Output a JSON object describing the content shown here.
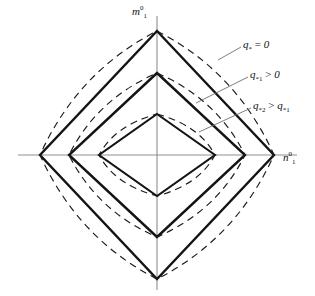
{
  "figure": {
    "kind": "yield-locus-diagram",
    "background": "#ffffff",
    "ink": "#111111",
    "axis_color": "#8a8a8a",
    "solid_color": "#141414",
    "dashed_color": "#1a1a1a"
  },
  "axes": {
    "y_label_base": "m",
    "y_label_sup": "0",
    "y_label_sub": "1",
    "x_label_base": "n",
    "x_label_sup": "0",
    "x_label_sub": "1",
    "origin_x": 157,
    "origin_y": 155,
    "x_axis_from": 18,
    "x_axis_to": 297,
    "y_axis_from": 16,
    "y_axis_to": 290
  },
  "annotations": [
    {
      "id": "q0",
      "base": "q",
      "sub": "*",
      "op": " = ",
      "rhs": "0",
      "rhs_sub": "",
      "text": "q* = 0",
      "leader_from_x": 241,
      "leader_from_y": 47,
      "leader_to_x": 218,
      "leader_to_y": 60,
      "target_curve": "outer"
    },
    {
      "id": "q1",
      "base": "q",
      "sub": "*1",
      "op": " > ",
      "rhs": "0",
      "rhs_sub": "",
      "text": "q*1 > 0",
      "leader_from_x": 248,
      "leader_from_y": 77,
      "leader_to_x": 196,
      "leader_to_y": 103,
      "target_curve": "middle"
    },
    {
      "id": "q2",
      "base": "q",
      "sub": "*2",
      "op": " > ",
      "rhs": "q",
      "rhs_sub": "*1",
      "text": "q*2 > q*1",
      "leader_from_x": 251,
      "leader_from_y": 108,
      "leader_to_x": 199,
      "leader_to_y": 132,
      "target_curve": "inner"
    }
  ],
  "chart_data": {
    "type": "line",
    "title": "",
    "xlabel": "n01",
    "ylabel": "m01",
    "legend_position": "right",
    "grid": false,
    "loci": [
      {
        "name": "q* = 0",
        "style": "solid-rhombus",
        "half_width_px": 117,
        "half_height_px": 124,
        "vertices_px": [
          {
            "x": 157,
            "y": 31
          },
          {
            "x": 274,
            "y": 155
          },
          {
            "x": 157,
            "y": 279
          },
          {
            "x": 40,
            "y": 155
          }
        ],
        "dashed_bulge_px": 15
      },
      {
        "name": "q*1 > 0",
        "style": "solid-rhombus",
        "half_width_px": 88,
        "half_height_px": 82,
        "vertices_px": [
          {
            "x": 157,
            "y": 73
          },
          {
            "x": 245,
            "y": 155
          },
          {
            "x": 157,
            "y": 237
          },
          {
            "x": 69,
            "y": 155
          }
        ],
        "dashed_bulge_px": 11
      },
      {
        "name": "q*2 > q*1",
        "style": "solid-rhombus",
        "half_width_px": 58,
        "half_height_px": 41,
        "vertices_px": [
          {
            "x": 157,
            "y": 114
          },
          {
            "x": 215,
            "y": 155
          },
          {
            "x": 157,
            "y": 196
          },
          {
            "x": 99,
            "y": 155
          }
        ],
        "dashed_bulge_px": 8
      }
    ]
  }
}
